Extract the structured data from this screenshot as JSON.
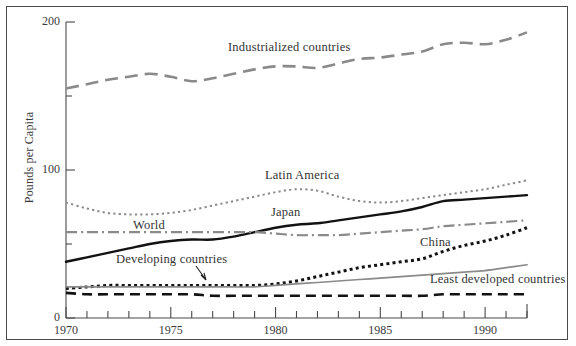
{
  "figure": {
    "ylabel": "Pounds per Capita",
    "frame": true
  },
  "labels": {
    "industrialized": "Industrialized countries",
    "latin_america": "Latin America",
    "japan": "Japan",
    "world": "World",
    "developing": "Developing countries",
    "china": "China",
    "least_developed": "Least developed countries"
  },
  "axes": {
    "y_ticks_major": [
      "0",
      "100",
      "200"
    ],
    "y_ticks_minor": [
      "50",
      "150"
    ],
    "x_ticks_major": [
      "1970",
      "1975",
      "1980",
      "1985",
      "1990"
    ]
  },
  "colors": {
    "gray_line": "#8a8a8a",
    "black_line": "#121212",
    "axis": "#4a4a4a",
    "text": "#333333"
  },
  "chart_data": {
    "type": "line",
    "title": "",
    "xlabel": "",
    "ylabel": "Pounds per Capita",
    "xlim": [
      1970,
      1992
    ],
    "ylim": [
      0,
      200
    ],
    "grid": false,
    "legend": "inline-annotations",
    "x": [
      1970,
      1971,
      1972,
      1973,
      1974,
      1975,
      1976,
      1977,
      1978,
      1979,
      1980,
      1981,
      1982,
      1983,
      1984,
      1985,
      1986,
      1987,
      1988,
      1989,
      1990,
      1991,
      1992
    ],
    "series": [
      {
        "name": "Industrialized countries",
        "style": "long-dashed",
        "color": "#8a8a8a",
        "values": [
          155,
          158,
          161,
          163,
          165,
          163,
          160,
          162,
          165,
          168,
          170,
          170,
          169,
          172,
          175,
          176,
          178,
          180,
          185,
          186,
          185,
          188,
          193
        ]
      },
      {
        "name": "Latin America",
        "style": "dotted",
        "color": "#8a8a8a",
        "values": [
          78,
          74,
          71,
          70,
          70,
          71,
          73,
          76,
          79,
          82,
          85,
          87,
          86,
          82,
          79,
          78,
          79,
          81,
          83,
          85,
          87,
          90,
          93
        ]
      },
      {
        "name": "Japan",
        "style": "solid",
        "color": "#121212",
        "values": [
          38,
          41,
          44,
          47,
          50,
          52,
          53,
          53,
          55,
          58,
          61,
          63,
          64,
          66,
          68,
          70,
          72,
          75,
          79,
          80,
          81,
          82,
          83
        ]
      },
      {
        "name": "World",
        "style": "dash-dot",
        "color": "#8a8a8a",
        "values": [
          58,
          58,
          58,
          58,
          58,
          58,
          58,
          58,
          58,
          58,
          57,
          56,
          56,
          56,
          57,
          58,
          59,
          60,
          62,
          63,
          64,
          65,
          66
        ]
      },
      {
        "name": "China",
        "style": "thick-dotted",
        "color": "#121212",
        "values": [
          20,
          21,
          22,
          22,
          22,
          22,
          22,
          22,
          22,
          22,
          23,
          25,
          28,
          31,
          34,
          36,
          38,
          40,
          45,
          49,
          52,
          56,
          61
        ]
      },
      {
        "name": "Developing countries",
        "style": "thin-solid",
        "color": "#8a8a8a",
        "values": [
          21,
          21,
          21,
          21,
          21,
          21,
          21,
          21,
          21,
          21,
          22,
          23,
          24,
          25,
          26,
          27,
          28,
          29,
          30,
          31,
          32,
          34,
          36
        ]
      },
      {
        "name": "Least developed countries",
        "style": "dashed",
        "color": "#121212",
        "values": [
          17,
          16,
          16,
          16,
          16,
          16,
          16,
          15,
          15,
          15,
          15,
          15,
          15,
          15,
          15,
          15,
          15,
          15,
          16,
          16,
          16,
          16,
          16
        ]
      }
    ]
  }
}
